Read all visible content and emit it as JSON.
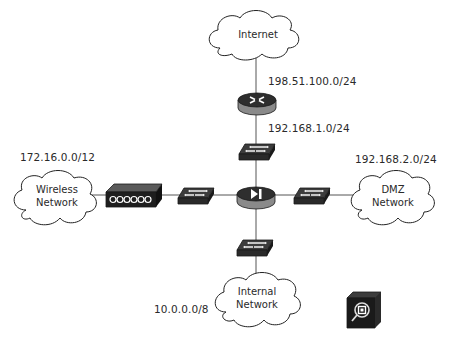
{
  "diagram": {
    "type": "network-topology",
    "colors": {
      "line": "#555555",
      "device_top": "#3c3c3c",
      "device_side": "#8a8a8a",
      "device_dark": "#1a1a1a",
      "cloud_stroke": "#222222",
      "text": "#2a2a2a"
    },
    "clouds": [
      {
        "id": "internet",
        "lines": [
          "Internet"
        ]
      },
      {
        "id": "wireless",
        "lines": [
          "Wireless",
          "Network"
        ]
      },
      {
        "id": "dmz",
        "lines": [
          "DMZ",
          "Network"
        ]
      },
      {
        "id": "internal",
        "lines": [
          "Internal",
          "Network"
        ]
      }
    ],
    "subnets": {
      "internet_link": "198.51.100.0/24",
      "router_link": "192.168.1.0/24",
      "wireless": "172.16.0.0/12",
      "dmz": "192.168.2.0/24",
      "internal": "10.0.0.0/8"
    },
    "devices": [
      {
        "id": "router",
        "icon": "router-icon"
      },
      {
        "id": "firewall",
        "icon": "firewall-icon"
      },
      {
        "id": "switch-top",
        "icon": "switch-icon"
      },
      {
        "id": "switch-left",
        "icon": "switch-icon"
      },
      {
        "id": "switch-right",
        "icon": "switch-icon"
      },
      {
        "id": "switch-bottom",
        "icon": "switch-icon"
      },
      {
        "id": "wireless-access-point",
        "icon": "access-point-icon"
      },
      {
        "id": "ids-sensor",
        "icon": "ids-inspection-icon"
      }
    ]
  }
}
